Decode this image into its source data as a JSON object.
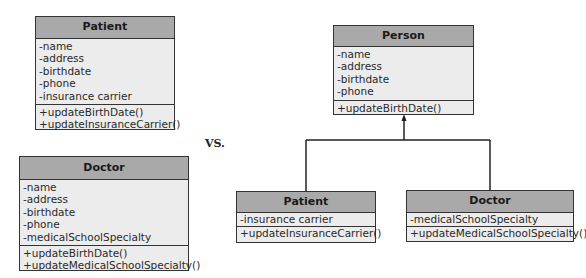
{
  "vs_label": "VS.",
  "colors": {
    "header_fill": "#a9a9a9",
    "body_fill": "#ececec",
    "border": "#333333"
  },
  "separate_classes": {
    "patient": {
      "name": "Patient",
      "attributes": [
        "-name",
        "-address",
        "-birthdate",
        "-phone",
        "-insurance carrier"
      ],
      "methods": [
        "+updateBirthDate()",
        "+updateInsuranceCarrier()"
      ]
    },
    "doctor": {
      "name": "Doctor",
      "attributes": [
        "-name",
        "-address",
        "-birthdate",
        "-phone",
        "-medicalSchoolSpecialty"
      ],
      "methods": [
        "+updateBirthDate()",
        "+updateMedicalSchoolSpecialty()"
      ]
    }
  },
  "inheritance": {
    "superclass": {
      "name": "Person",
      "attributes": [
        "-name",
        "-address",
        "-birthdate",
        "-phone"
      ],
      "methods": [
        "+updateBirthDate()"
      ]
    },
    "subclasses": [
      {
        "name": "Patient",
        "attributes": [
          "-insurance carrier"
        ],
        "methods": [
          "+updateInsuranceCarrier()"
        ]
      },
      {
        "name": "Doctor",
        "attributes": [
          "-medicalSchoolSpecialty"
        ],
        "methods": [
          "+updateMedicalSchoolSpecialty()"
        ]
      }
    ],
    "relationship": "generalization"
  }
}
